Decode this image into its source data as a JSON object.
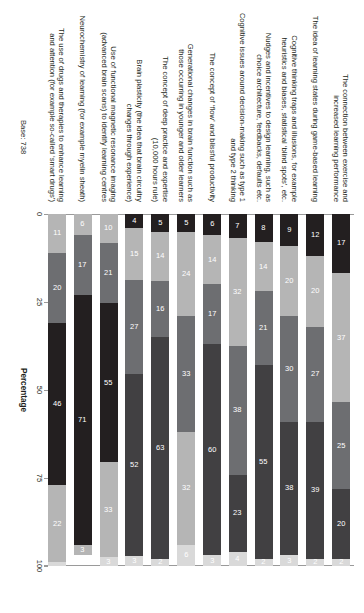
{
  "chart_data": {
    "type": "bar",
    "orientation": "horizontal-stacked",
    "title": "",
    "subtitle": "",
    "xlabel": "Percentage",
    "ylabel": "",
    "xlim": [
      0,
      100
    ],
    "xticks": [
      "0",
      "25",
      "50",
      "75",
      "100"
    ],
    "grid": false,
    "legend_position": "none",
    "base_note": "Base: 738",
    "stack_order_note": "segments plotted left to right per row",
    "series": [
      {
        "name": "s1",
        "color": "#231f20",
        "values": [
          17,
          12,
          9,
          8,
          7,
          6,
          5,
          5,
          4,
          10,
          6,
          11
        ]
      },
      {
        "name": "s2",
        "color": "#b5b5b5",
        "values": [
          37,
          20,
          20,
          14,
          32,
          14,
          24,
          14,
          15,
          21,
          17,
          20
        ]
      },
      {
        "name": "s3",
        "color": "#6d6e71",
        "values": [
          25,
          27,
          30,
          21,
          38,
          17,
          33,
          16,
          27,
          55,
          46,
          46
        ]
      },
      {
        "name": "s4",
        "color": "#414042",
        "values": [
          20,
          39,
          38,
          55,
          23,
          60,
          32,
          63,
          52,
          33,
          71,
          22
        ]
      },
      {
        "name": "s5",
        "color": "#d9d9d9",
        "values": [
          2,
          2,
          3,
          2,
          4,
          3,
          0,
          2,
          3,
          3,
          3,
          1
        ]
      }
    ],
    "categories": [
      "The connection between exercise and increased learning performance",
      "The idea of learning states during game-based learning",
      "Cognitive thinking traps and illusions, for example heuristics and biases, statistical ‘blind spots’, etc.",
      "Nudges and incentives to design learning, such as choice architecture, feedbacks, defaults etc.",
      "Cognitive issues around decision-making such as type 1 and type 2 thinking",
      "The concept of ‘flow’ and blissful productivity",
      "Generational changes in brain function such as those occurring in younger and older learners",
      "The concept of deep practice and expertise (10,000 hours rule)",
      "Brain plasticity (the idea that brain circuitry changes through experience)",
      "Use of functional magnetic resonance imaging (advanced brain scans) to identify learning centres",
      "Neurochemistry of learning (for example myelin sheath)",
      "The use of drugs and therapies to enhance learning and attention (for example so-called ‘smart drugs’)"
    ],
    "rows": [
      {
        "label": "The connection between exercise and increased learning performance",
        "label_lines": [
          "The connection between exercise and",
          "increased learning performance"
        ],
        "segments": [
          {
            "value": 17,
            "label": "17",
            "color": "#231f20",
            "text_color": "#ffffff"
          },
          {
            "value": 37,
            "label": "37",
            "color": "#b5b5b5",
            "text_color": "#ffffff"
          },
          {
            "value": 25,
            "label": "25",
            "color": "#6d6e71",
            "text_color": "#ffffff"
          },
          {
            "value": 20,
            "label": "20",
            "color": "#414042",
            "text_color": "#ffffff"
          },
          {
            "value": 2,
            "label": "2",
            "color": "#d9d9d9",
            "text_color": "#ffffff"
          }
        ]
      },
      {
        "label": "The idea of learning states during game-based learning",
        "label_lines": [
          "The idea of learning states during game-based learning"
        ],
        "segments": [
          {
            "value": 12,
            "label": "12",
            "color": "#231f20",
            "text_color": "#ffffff"
          },
          {
            "value": 20,
            "label": "20",
            "color": "#b5b5b5",
            "text_color": "#ffffff"
          },
          {
            "value": 27,
            "label": "27",
            "color": "#6d6e71",
            "text_color": "#ffffff"
          },
          {
            "value": 39,
            "label": "39",
            "color": "#414042",
            "text_color": "#ffffff"
          },
          {
            "value": 2,
            "label": "2",
            "color": "#d9d9d9",
            "text_color": "#ffffff"
          }
        ]
      },
      {
        "label": "Cognitive thinking traps and illusions, for example heuristics and biases, statistical ‘blind spots’, etc.",
        "label_lines": [
          "Cognitive thinking traps and illusions, for example",
          "heuristics and biases, statistical ‘blind spots’, etc."
        ],
        "segments": [
          {
            "value": 9,
            "label": "9",
            "color": "#231f20",
            "text_color": "#ffffff"
          },
          {
            "value": 20,
            "label": "20",
            "color": "#b5b5b5",
            "text_color": "#ffffff"
          },
          {
            "value": 30,
            "label": "30",
            "color": "#6d6e71",
            "text_color": "#ffffff"
          },
          {
            "value": 38,
            "label": "38",
            "color": "#414042",
            "text_color": "#ffffff"
          },
          {
            "value": 3,
            "label": "3",
            "color": "#d9d9d9",
            "text_color": "#ffffff"
          }
        ]
      },
      {
        "label": "Nudges and incentives to design learning, such as choice architecture, feedbacks, defaults etc.",
        "label_lines": [
          "Nudges and incentives to design learning, such as",
          "choice architecture, feedbacks, defaults etc."
        ],
        "segments": [
          {
            "value": 8,
            "label": "8",
            "color": "#231f20",
            "text_color": "#ffffff"
          },
          {
            "value": 14,
            "label": "14",
            "color": "#b5b5b5",
            "text_color": "#ffffff"
          },
          {
            "value": 21,
            "label": "21",
            "color": "#6d6e71",
            "text_color": "#ffffff"
          },
          {
            "value": 55,
            "label": "55",
            "color": "#414042",
            "text_color": "#ffffff"
          },
          {
            "value": 2,
            "label": "2",
            "color": "#d9d9d9",
            "text_color": "#ffffff"
          }
        ]
      },
      {
        "label": "Cognitive issues around decision-making such as type 1 and type 2 thinking",
        "label_lines": [
          "Cognitive issues around decision-making such as type 1",
          "and type 2 thinking"
        ],
        "segments": [
          {
            "value": 7,
            "label": "7",
            "color": "#231f20",
            "text_color": "#ffffff"
          },
          {
            "value": 32,
            "label": "32",
            "color": "#b5b5b5",
            "text_color": "#ffffff"
          },
          {
            "value": 38,
            "label": "38",
            "color": "#6d6e71",
            "text_color": "#ffffff"
          },
          {
            "value": 23,
            "label": "23",
            "color": "#414042",
            "text_color": "#ffffff"
          },
          {
            "value": 4,
            "label": "4",
            "color": "#d9d9d9",
            "text_color": "#ffffff"
          }
        ]
      },
      {
        "label": "The concept of ‘flow’ and blissful productivity",
        "label_lines": [
          "The concept of ‘flow’ and blissful productivity"
        ],
        "segments": [
          {
            "value": 6,
            "label": "6",
            "color": "#231f20",
            "text_color": "#ffffff"
          },
          {
            "value": 14,
            "label": "14",
            "color": "#b5b5b5",
            "text_color": "#ffffff"
          },
          {
            "value": 17,
            "label": "17",
            "color": "#6d6e71",
            "text_color": "#ffffff"
          },
          {
            "value": 60,
            "label": "60",
            "color": "#414042",
            "text_color": "#ffffff"
          },
          {
            "value": 3,
            "label": "3",
            "color": "#d9d9d9",
            "text_color": "#ffffff"
          }
        ]
      },
      {
        "label": "Generational changes in brain function such as those occurring in younger and older learners",
        "label_lines": [
          "Generational changes in brain function such as",
          "those occurring in younger and older learners"
        ],
        "segments": [
          {
            "value": 5,
            "label": "5",
            "color": "#231f20",
            "text_color": "#ffffff"
          },
          {
            "value": 24,
            "label": "24",
            "color": "#b5b5b5",
            "text_color": "#ffffff"
          },
          {
            "value": 33,
            "label": "33",
            "color": "#6d6e71",
            "text_color": "#ffffff"
          },
          {
            "value": 32,
            "label": "32",
            "color": "#b5b5b5",
            "text_color": "#ffffff"
          },
          {
            "value": 6,
            "label": "6",
            "color": "#d9d9d9",
            "text_color": "#ffffff"
          }
        ]
      },
      {
        "label": "The concept of deep practice and expertise (10,000 hours rule)",
        "label_lines": [
          "The concept of deep practice and expertise",
          "(10,000 hours rule)"
        ],
        "segments": [
          {
            "value": 5,
            "label": "5",
            "color": "#231f20",
            "text_color": "#ffffff"
          },
          {
            "value": 14,
            "label": "14",
            "color": "#b5b5b5",
            "text_color": "#ffffff"
          },
          {
            "value": 16,
            "label": "16",
            "color": "#6d6e71",
            "text_color": "#ffffff"
          },
          {
            "value": 63,
            "label": "63",
            "color": "#414042",
            "text_color": "#ffffff"
          },
          {
            "value": 2,
            "label": "2",
            "color": "#d9d9d9",
            "text_color": "#ffffff"
          }
        ]
      },
      {
        "label": "Brain plasticity (the idea that brain circuitry changes through experience)",
        "label_lines": [
          "Brain plasticity (the idea that brain circuitry",
          "changes through experience)"
        ],
        "segments": [
          {
            "value": 4,
            "label": "4",
            "color": "#231f20",
            "text_color": "#ffffff"
          },
          {
            "value": 15,
            "label": "15",
            "color": "#b5b5b5",
            "text_color": "#ffffff"
          },
          {
            "value": 27,
            "label": "27",
            "color": "#6d6e71",
            "text_color": "#ffffff"
          },
          {
            "value": 52,
            "label": "52",
            "color": "#414042",
            "text_color": "#ffffff"
          },
          {
            "value": 3,
            "label": "3",
            "color": "#d9d9d9",
            "text_color": "#ffffff"
          }
        ]
      },
      {
        "label": "Use of functional magnetic resonance imaging (advanced brain scans) to identify learning centres",
        "label_lines": [
          "Use of functional magnetic resonance imaging",
          "(advanced brain scans) to identify learning centres"
        ],
        "segments": [
          {
            "value": 10,
            "label": "10",
            "color": "#b5b5b5",
            "text_color": "#ffffff"
          },
          {
            "value": 21,
            "label": "21",
            "color": "#6d6e71",
            "text_color": "#ffffff"
          },
          {
            "value": 55,
            "label": "55",
            "color": "#231f20",
            "text_color": "#ffffff"
          },
          {
            "value": 33,
            "label": "33",
            "color": "#b5b5b5",
            "text_color": "#ffffff"
          },
          {
            "value": 3,
            "label": "3",
            "color": "#d9d9d9",
            "text_color": "#ffffff"
          }
        ]
      },
      {
        "label": "Neurochemistry of learning (for example myelin sheath)",
        "label_lines": [
          "Neurochemistry of learning (for example myelin sheath)"
        ],
        "segments": [
          {
            "value": 6,
            "label": "6",
            "color": "#b5b5b5",
            "text_color": "#ffffff"
          },
          {
            "value": 17,
            "label": "17",
            "color": "#6d6e71",
            "text_color": "#ffffff"
          },
          {
            "value": 71,
            "label": "71",
            "color": "#231f20",
            "text_color": "#ffffff"
          },
          {
            "value": 3,
            "label": "3",
            "color": "#b5b5b5",
            "text_color": "#ffffff"
          }
        ]
      },
      {
        "label": "The use of drugs and therapies to enhance learning and attention (for example so-called ‘smart drugs’)",
        "label_lines": [
          "The use of drugs and therapies to enhance learning",
          "and attention (for example so-called ‘smart drugs’)"
        ],
        "segments": [
          {
            "value": 11,
            "label": "11",
            "color": "#b5b5b5",
            "text_color": "#ffffff"
          },
          {
            "value": 20,
            "label": "20",
            "color": "#6d6e71",
            "text_color": "#ffffff"
          },
          {
            "value": 46,
            "label": "46",
            "color": "#231f20",
            "text_color": "#ffffff"
          },
          {
            "value": 22,
            "label": "22",
            "color": "#b5b5b5",
            "text_color": "#ffffff"
          },
          {
            "value": 1,
            "label": "",
            "color": "#d9d9d9",
            "text_color": "#ffffff"
          }
        ]
      }
    ]
  }
}
